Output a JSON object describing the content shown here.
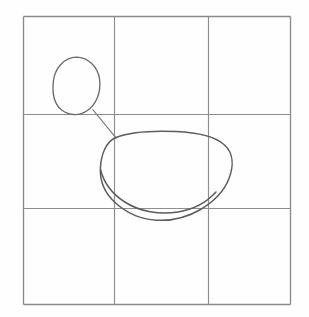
{
  "figure": {
    "kind": "hand-drawn-diagram",
    "title": "Two closed curves on a 3x3 grid",
    "background_color": "#fefefe",
    "width": 309,
    "height": 317
  },
  "frame": {
    "name": "outer-square-border",
    "color": "#8a8a8a",
    "left": 23,
    "top": 16,
    "right": 291,
    "bottom": 305,
    "width": 268,
    "height": 289
  },
  "grid": {
    "color": "#8e8e8e",
    "rows": 3,
    "columns": 3,
    "vertical_lines_x": [
      114,
      208
    ],
    "horizontal_lines_y": [
      114,
      208
    ],
    "cell_labels": [
      "top-left",
      "top-center",
      "top-right",
      "middle-left",
      "middle-center",
      "middle-right",
      "bottom-left",
      "bottom-center",
      "bottom-right"
    ]
  },
  "shapes": [
    {
      "name": "small-blob",
      "label": "small egg-shaped closed curve",
      "color": "#6b6b6b",
      "cell": "top-left",
      "bounds": {
        "x": 53,
        "y": 57,
        "width": 47,
        "height": 58
      },
      "center": {
        "x": 76,
        "y": 86
      },
      "path": "M 76.5 57.2 C 88.5 57.6 98.0 67.0 99.6 79.5 C 101.2 92.5 96.2 104.5 87.0 110.8 C 79.0 116.3 68.5 115.6 61.4 109.8 C 53.6 103.5 52.2 92.0 53.4 81.0 C 54.7 69.0 63.5 57.4 76.5 57.2 Z"
    },
    {
      "name": "large-blob",
      "label": "large rounded potato-shaped closed curve",
      "color": "#5d5d5d",
      "cell": "middle-center",
      "bounds": {
        "x": 100,
        "y": 131,
        "width": 133,
        "height": 90
      },
      "center": {
        "x": 166,
        "y": 176
      },
      "path": "M 116.0 137.5 C 131.0 131.8 154.0 130.6 176.0 131.6 C 197.0 132.5 214.5 136.0 224.5 145.0 C 233.8 153.4 233.6 166.5 229.0 178.5 C 224.0 191.5 214.0 201.5 200.5 209.5 C 187.0 217.5 171.0 221.0 156.5 220.2 C 141.0 219.4 126.5 213.0 115.0 202.5 C 103.8 192.2 99.8 180.0 100.4 168.0 C 101.0 155.0 106.0 141.3 116.0 137.5 Z"
    },
    {
      "name": "large-blob-tail",
      "label": "curve tail crossing near the middle-right gridline",
      "color": "#5d5d5d",
      "crossing_point": {
        "x": 210,
        "y": 208
      },
      "path": "M 100.6 170.0 C 104.0 183.0 112.5 194.0 124.0 201.5 C 140.0 212.0 160.0 215.0 178.0 212.0 C 194.0 209.3 207.0 202.0 216.0 192.0"
    },
    {
      "name": "connector-line",
      "label": "straight line linking small blob to large blob",
      "color": "#7a7a7a",
      "from": {
        "x": 93,
        "y": 110
      },
      "to": {
        "x": 116,
        "y": 138
      },
      "path": "M 92.8 109.6 L 116.2 138.2"
    }
  ]
}
